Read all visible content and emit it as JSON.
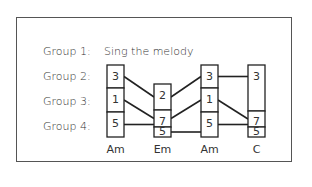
{
  "groups": [
    {
      "label": "Group 1:",
      "instruction": "Sing the melody"
    },
    {
      "label": "Group 2:"
    },
    {
      "label": "Group 3:"
    },
    {
      "label": "Group 4:"
    }
  ],
  "chords": [
    {
      "name": "Am",
      "cells": [
        {
          "value": "3",
          "y0": 65,
          "y1": 88
        },
        {
          "value": "1",
          "y0": 88,
          "y1": 112
        },
        {
          "value": "5",
          "y0": 112,
          "y1": 137
        }
      ],
      "x": 107
    },
    {
      "name": "Em",
      "cells": [
        {
          "value": "2",
          "y0": 84,
          "y1": 110
        },
        {
          "value": "7",
          "y0": 110,
          "y1": 127
        },
        {
          "value": "5",
          "y0": 127,
          "y1": 137
        }
      ],
      "x": 154
    },
    {
      "name": "Am",
      "cells": [
        {
          "value": "3",
          "y0": 65,
          "y1": 88
        },
        {
          "value": "1",
          "y0": 88,
          "y1": 112
        },
        {
          "value": "5",
          "y0": 112,
          "y1": 137
        }
      ],
      "x": 201
    },
    {
      "name": "C",
      "cells": [
        {
          "value": "3",
          "y0": 65,
          "y1": 111
        },
        {
          "value": "7",
          "y0": 111,
          "y1": 127
        },
        {
          "value": "5",
          "y0": 127,
          "y1": 137
        }
      ],
      "x": 248
    }
  ],
  "colors": {
    "line": "#222222",
    "text": "#333333",
    "frame": "#555555"
  }
}
